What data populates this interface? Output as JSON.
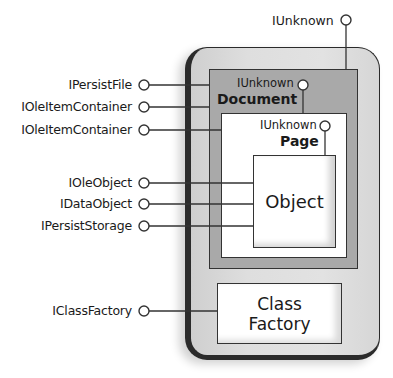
{
  "diagram": {
    "type": "COM object interface diagram",
    "outer_container": {
      "label": ""
    },
    "top_interface": {
      "label": "IUnknown"
    },
    "document": {
      "title": "Document",
      "iunknown_label": "IUnknown"
    },
    "page": {
      "title": "Page",
      "iunknown_label": "IUnknown"
    },
    "object": {
      "title": "Object"
    },
    "class_factory": {
      "line1": "Class",
      "line2": "Factory"
    },
    "interfaces": [
      {
        "label": "IPersistFile",
        "connects_to": "Document"
      },
      {
        "label": "IOleItemContainer",
        "connects_to": "Document"
      },
      {
        "label": "IOleItemContainer",
        "connects_to": "Page"
      },
      {
        "label": "IOleObject",
        "connects_to": "Object"
      },
      {
        "label": "IDataObject",
        "connects_to": "Object"
      },
      {
        "label": "IPersistStorage",
        "connects_to": "Object"
      },
      {
        "label": "IClassFactory",
        "connects_to": "Class Factory"
      }
    ]
  },
  "colors": {
    "outer_fill": "#dedede",
    "document_fill": "#a9a9a9",
    "page_fill": "#ffffff",
    "line": "#333333"
  }
}
